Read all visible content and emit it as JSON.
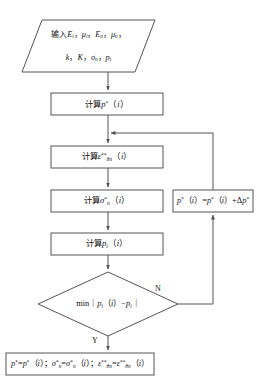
{
  "diagram": {
    "language": "zh-CN",
    "background_color": "#ffffff",
    "line_color": "#555555",
    "text_color": "#141414"
  },
  "nodes": {
    "input": {
      "shape": "parallelogram",
      "line1": "输入E i , μ i , E n , μ n ,",
      "line2": "k , K , σ n , p i",
      "plain": "输入E_i, μ_i, E_n, μ_n, k, K, σ_n, p_i"
    },
    "calc_p_star": {
      "shape": "process",
      "plain": "计算p*(i)"
    },
    "calc_epsilon": {
      "shape": "process",
      "plain": "计算ε**_θn(i)"
    },
    "calc_sigma": {
      "shape": "process",
      "plain": "计算σ*_n(i)"
    },
    "calc_pi": {
      "shape": "process",
      "plain": "计算p_i(i)"
    },
    "decision": {
      "shape": "diamond",
      "plain": "min | p_i(i) − p_i |"
    },
    "update": {
      "shape": "process",
      "plain": "p*(i) = p*(i) + Δp*"
    },
    "output": {
      "shape": "process",
      "plain": "p*=p*(i) ; σ*_n=σ*_n(i) ; ε**_θn=ε**_θn(i)"
    }
  },
  "branches": {
    "no_label": "N",
    "yes_label": "Y"
  }
}
